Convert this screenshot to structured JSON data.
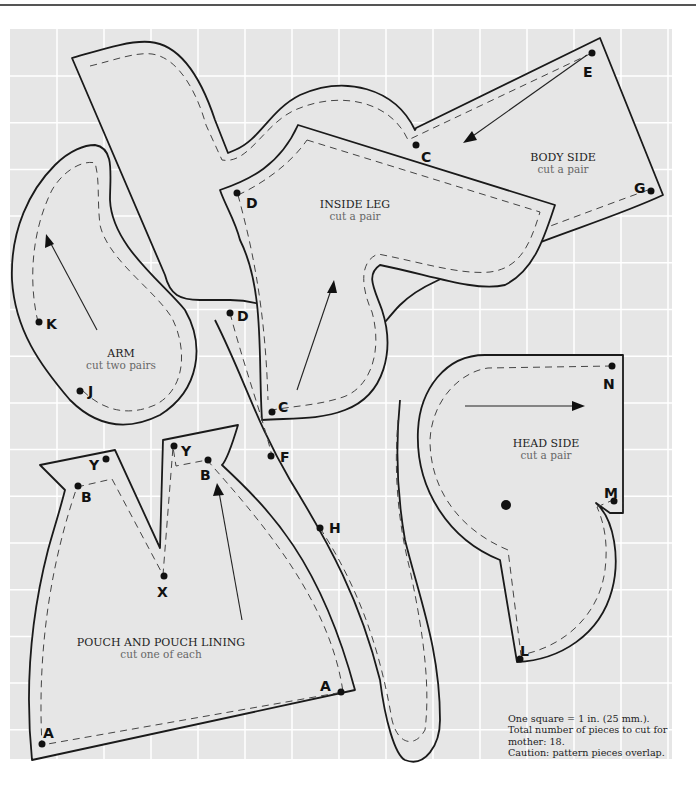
{
  "grid": {
    "scale_note": "One square = 1 in. (25 mm.).",
    "background_color": "#e6e6e6",
    "line_color": "#ffffff"
  },
  "pieces": {
    "body_side": {
      "title": "BODY SIDE",
      "instruction": "cut a pair",
      "points": [
        "C",
        "E",
        "G"
      ]
    },
    "inside_leg": {
      "title": "INSIDE LEG",
      "instruction": "cut a pair",
      "points": [
        "D",
        "C"
      ]
    },
    "arm": {
      "title": "ARM",
      "instruction": "cut two pairs",
      "points": [
        "K",
        "J"
      ]
    },
    "head_side": {
      "title": "HEAD SIDE",
      "instruction": "cut a pair",
      "points": [
        "N",
        "M",
        "L"
      ]
    },
    "pouch": {
      "title": "POUCH AND POUCH  LINING",
      "instruction": "cut one of each",
      "points": [
        "Y",
        "B",
        "X",
        "Y",
        "B",
        "A",
        "A"
      ]
    },
    "body_strip": {
      "points": [
        "D",
        "F",
        "H"
      ]
    }
  },
  "labels": {
    "E": "E",
    "C1": "C",
    "G": "G",
    "D1": "D",
    "D2": "D",
    "C2": "C",
    "K": "K",
    "J": "J",
    "N": "N",
    "M": "M",
    "L": "L",
    "Y1": "Y",
    "B1": "B",
    "Y2": "Y",
    "B2": "B",
    "X": "X",
    "F": "F",
    "H": "H",
    "A1": "A",
    "A2": "A"
  },
  "notes": {
    "line1": "One square = 1 in. (25 mm.).",
    "line2": "Total number of pieces to cut for",
    "line3": "mother: 18.",
    "line4": "Caution: pattern pieces overlap."
  }
}
